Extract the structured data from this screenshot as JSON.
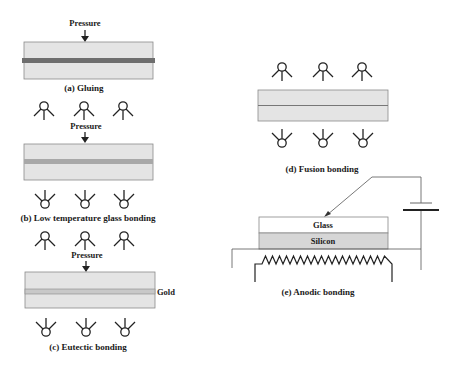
{
  "labels": {
    "pressure": "Pressure",
    "gold": "Gold",
    "glass": "Glass",
    "silicon": "Silicon"
  },
  "captions": {
    "a": "(a) Gluing",
    "b": "(b) Low temperature glass bonding",
    "c": "(c) Eutectic bonding",
    "d": "(d) Fusion bonding",
    "e": "(e) Anodic bonding"
  },
  "colors": {
    "plate": "#e4e4e4",
    "glue_layer": "#6e6e6e",
    "glass_layer": "#a8a8a8",
    "gold_layer": "#c8c8c8",
    "silicon": "#d6d6d6"
  },
  "icons": {
    "lamp": "heat-lamp-icon",
    "arrow": "pressure-arrow-icon",
    "heater": "resistive-heater-icon",
    "battery": "battery-icon"
  }
}
